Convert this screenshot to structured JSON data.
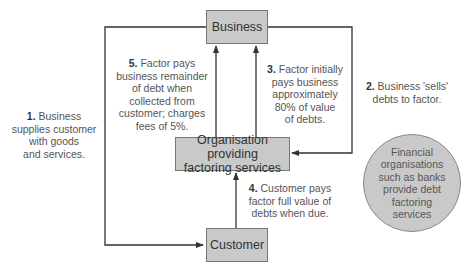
{
  "diagram": {
    "nodes": {
      "business": "Business",
      "factor_line1": "Organisation providing",
      "factor_line2": "factoring services",
      "customer": "Customer"
    },
    "steps": [
      {
        "num": "1.",
        "text_lines": [
          "Business",
          "supplies customer",
          "with goods",
          "and services."
        ]
      },
      {
        "num": "2.",
        "text_lines": [
          "Business 'sells'",
          "debts to factor."
        ]
      },
      {
        "num": "3.",
        "text_lines": [
          "Factor initially",
          "pays business",
          "approximately",
          "80% of value",
          "of debts."
        ]
      },
      {
        "num": "4.",
        "text_lines": [
          "Customer pays",
          "factor full value of",
          "debts when due."
        ]
      },
      {
        "num": "5.",
        "text_lines": [
          "Factor pays",
          "business remainder",
          "of debt when",
          "collected from",
          "customer; charges",
          "fees of 5%."
        ]
      }
    ],
    "note_circle": [
      "Financial",
      "organisations",
      "such as banks",
      "provide debt",
      "factoring",
      "services"
    ]
  },
  "colors": {
    "box_fill": "#c9c9c9",
    "line": "#333333"
  }
}
